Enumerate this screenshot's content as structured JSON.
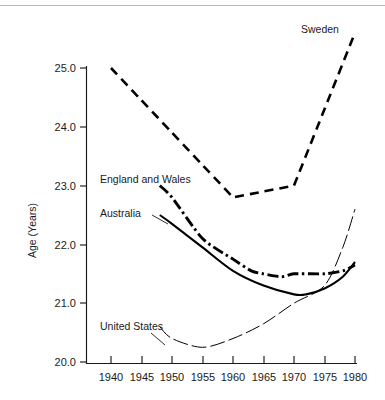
{
  "figure": {
    "background_color": "#ffffff",
    "line_color": "#000000",
    "rule_color": "#b8b8b8"
  },
  "axes": {
    "y_title": "Age (Years)",
    "x_title": "",
    "y_ticks": [
      "25.0",
      "24.0",
      "23.0",
      "22.0",
      "21.0",
      "20.0"
    ],
    "x_ticks": [
      "1940",
      "1945",
      "1950",
      "1955",
      "1960",
      "1965",
      "1970",
      "1975",
      "1980"
    ]
  },
  "labels": {
    "sweden": "Sweden",
    "england_and_wales": "England and Wales",
    "australia": "Australia",
    "united_states": "United States"
  },
  "chart_data": {
    "type": "line",
    "title": "",
    "subtitle": "",
    "xlabel": "",
    "ylabel": "Age (Years)",
    "xlim": [
      1936,
      1982
    ],
    "ylim": [
      20.0,
      25.8
    ],
    "ytick_values": [
      25.0,
      24.0,
      23.0,
      22.0,
      21.0,
      20.0
    ],
    "xtick_values": [
      1940,
      1945,
      1950,
      1955,
      1960,
      1965,
      1970,
      1975,
      1980
    ],
    "grid": false,
    "legend": "inline-annotations",
    "series": [
      {
        "name": "Sweden",
        "style": "dashed",
        "linewidth": "heavy",
        "x": [
          1940,
          1945,
          1950,
          1955,
          1960,
          1965,
          1970,
          1975,
          1980
        ],
        "y": [
          25.0,
          24.45,
          23.9,
          23.35,
          22.8,
          22.9,
          23.0,
          24.3,
          25.6
        ]
      },
      {
        "name": "England and Wales",
        "style": "dash-dot",
        "linewidth": "heavy",
        "x": [
          1948,
          1950,
          1955,
          1960,
          1963,
          1965,
          1968,
          1970,
          1975,
          1978,
          1980
        ],
        "y": [
          23.0,
          22.8,
          22.1,
          21.75,
          21.55,
          21.5,
          21.45,
          21.5,
          21.5,
          21.55,
          21.65
        ]
      },
      {
        "name": "Australia",
        "style": "solid",
        "linewidth": "medium",
        "x": [
          1948,
          1950,
          1955,
          1960,
          1965,
          1970,
          1972,
          1975,
          1978,
          1980
        ],
        "y": [
          22.5,
          22.35,
          21.95,
          21.55,
          21.3,
          21.15,
          21.15,
          21.25,
          21.45,
          21.7
        ]
      },
      {
        "name": "United States",
        "style": "dashed-thin",
        "linewidth": "thin",
        "x": [
          1948,
          1950,
          1955,
          1960,
          1965,
          1970,
          1975,
          1978,
          1980
        ],
        "y": [
          20.6,
          20.4,
          20.25,
          20.4,
          20.65,
          21.0,
          21.3,
          21.95,
          22.6
        ]
      }
    ]
  }
}
